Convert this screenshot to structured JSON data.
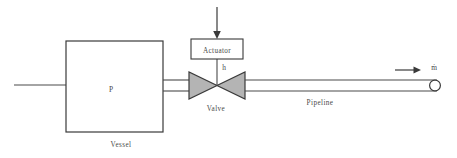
{
  "diagram": {
    "colors": {
      "line": "#4a4a4a",
      "line_dark": "#3a3a3a",
      "valve_fill": "#b4b4b4",
      "background": "#ffffff",
      "text": "#4a4a4a"
    },
    "vessel": {
      "label": "Vessel",
      "inner_symbol": "P"
    },
    "actuator": {
      "label": "Actuator",
      "signal_label": "h"
    },
    "valve": {
      "label": "Valve"
    },
    "pipeline": {
      "label": "Pipeline"
    },
    "outlet": {
      "flow_symbol": "ṁ"
    }
  }
}
